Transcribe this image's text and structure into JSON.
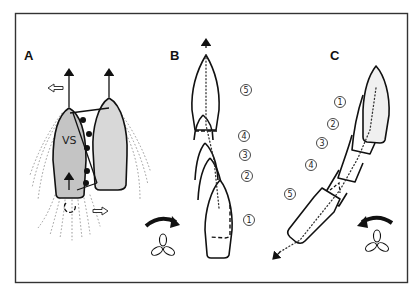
{
  "figure": {
    "type": "boat-maneuvering-diagram",
    "frame_color": "#333333",
    "hull_fill_shaded": "#c8c8c8",
    "hull_fill_light": "#ececec"
  },
  "panels": {
    "A": {
      "label": "A",
      "vessel_label": "VS",
      "description": "Two boats side by side with fenders between; propeller wash and lateral thrust arrows"
    },
    "B": {
      "label": "B",
      "steps": [
        "1",
        "2",
        "3",
        "4",
        "5"
      ],
      "description": "Boat moving straight ahead, successive positions 1–5; propeller turning clockwise"
    },
    "C": {
      "label": "C",
      "steps": [
        "1",
        "2",
        "3",
        "4",
        "5"
      ],
      "description": "Boat backing away at an angle, successive positions 1–5; propeller turning counter-clockwise"
    }
  },
  "icons": {
    "propeller_B": "propeller-clockwise-icon",
    "propeller_C": "propeller-counterclockwise-icon"
  }
}
